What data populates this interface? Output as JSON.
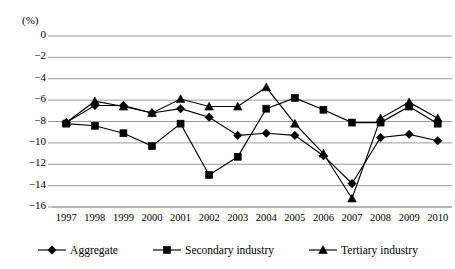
{
  "chart_data": {
    "type": "line",
    "title": "",
    "subtitle": "",
    "xlabel": "",
    "ylabel": "(%)",
    "unit_label": "(%)",
    "categories": [
      "1997",
      "1998",
      "1999",
      "2000",
      "2001",
      "2002",
      "2003",
      "2004",
      "2005",
      "2006",
      "2007",
      "2008",
      "2009",
      "2010"
    ],
    "x": [
      1997,
      1998,
      1999,
      2000,
      2001,
      2002,
      2003,
      2004,
      2005,
      2006,
      2007,
      2008,
      2009,
      2010
    ],
    "ylim": [
      -16,
      0
    ],
    "yticks": [
      "0",
      "−2",
      "−4",
      "−6",
      "−8",
      "−10",
      "−12",
      "−14",
      "−16"
    ],
    "ytick_values": [
      0,
      -2,
      -4,
      -6,
      -8,
      -10,
      -12,
      -14,
      -16
    ],
    "grid": true,
    "legend_position": "bottom",
    "series": [
      {
        "name": "Aggregate",
        "marker": "diamond",
        "values": [
          -8.1,
          -6.5,
          -6.5,
          -7.2,
          -6.8,
          -7.6,
          -9.3,
          -9.1,
          -9.3,
          -11.2,
          -13.8,
          -9.5,
          -9.2,
          -9.8
        ]
      },
      {
        "name": "Secondary industry",
        "marker": "square",
        "values": [
          -8.2,
          -8.4,
          -9.1,
          -10.3,
          -8.2,
          -13.0,
          -11.3,
          -6.8,
          -5.8,
          -6.9,
          -8.1,
          -8.1,
          -6.6,
          -8.2
        ]
      },
      {
        "name": "Tertiary industry",
        "marker": "triangle",
        "values": [
          -8.1,
          -6.1,
          -6.6,
          -7.2,
          -5.9,
          -6.6,
          -6.6,
          -4.8,
          -8.2,
          -11.0,
          -15.2,
          -7.7,
          -6.2,
          -7.7
        ]
      }
    ]
  },
  "legend": {
    "items": [
      {
        "label": "Aggregate",
        "marker": "diamond"
      },
      {
        "label": "Secondary industry",
        "marker": "square"
      },
      {
        "label": "Tertiary industry",
        "marker": "triangle"
      }
    ]
  },
  "colors": {
    "line": "#000000",
    "grid": "#9a9a9a",
    "axis": "#6e6e6e",
    "background": "#ffffff"
  }
}
